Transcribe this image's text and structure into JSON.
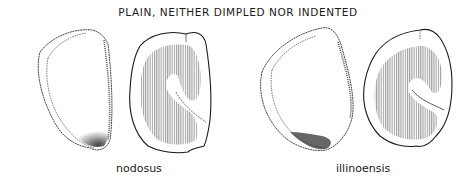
{
  "figure": {
    "title": "PLAIN, NEITHER DIMPLED NOR INDENTED",
    "specimens": [
      {
        "label": "nodosus",
        "views": [
          "exterior-view",
          "cross-section-view"
        ]
      },
      {
        "label": "illinoensis",
        "views": [
          "exterior-view",
          "cross-section-view"
        ]
      }
    ],
    "colors": {
      "ink": "#1a1a1a",
      "hatch": "#8a8a8a",
      "background": "#ffffff"
    }
  }
}
